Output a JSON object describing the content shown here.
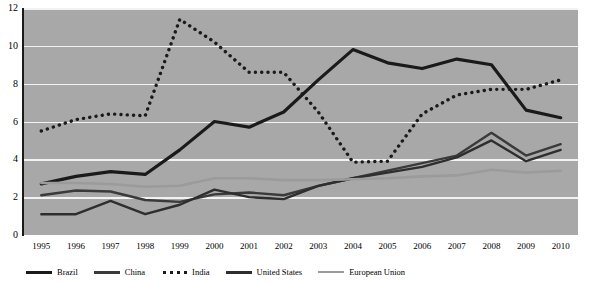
{
  "chart_data": {
    "type": "line",
    "title": "",
    "xlabel": "",
    "ylabel": "",
    "x": [
      1995,
      1996,
      1997,
      1998,
      1999,
      2000,
      2001,
      2002,
      2003,
      2004,
      2005,
      2006,
      2007,
      2008,
      2009,
      2010
    ],
    "xtick_labels": [
      "1995",
      "1996",
      "1997",
      "1998",
      "1999",
      "2000",
      "2001",
      "2002",
      "2003",
      "2004",
      "2005",
      "2006",
      "2007",
      "2008",
      "2009",
      "2010"
    ],
    "ytick_labels": [
      "0",
      "2",
      "4",
      "6",
      "8",
      "10",
      "12"
    ],
    "yticks": [
      0,
      2,
      4,
      6,
      8,
      10,
      12
    ],
    "ylim": [
      0,
      12
    ],
    "grid": true,
    "legend_position": "bottom",
    "plot_background": "#a8a8a8",
    "gridline_color": "#f2f2f2",
    "series": [
      {
        "name": "Brazil",
        "color": "#1a1a1a",
        "style": "solid",
        "width": 3.2,
        "values": [
          2.7,
          3.1,
          3.35,
          3.2,
          4.5,
          6.0,
          5.7,
          6.5,
          8.2,
          9.8,
          9.1,
          8.8,
          9.3,
          9.0,
          6.6,
          6.2
        ]
      },
      {
        "name": "China",
        "color": "#3a3a3a",
        "style": "solid",
        "width": 2.4,
        "values": [
          2.1,
          2.35,
          2.3,
          1.85,
          1.75,
          2.15,
          2.25,
          2.1,
          2.6,
          3.0,
          3.4,
          3.8,
          4.2,
          5.4,
          4.2,
          4.8
        ]
      },
      {
        "name": "India",
        "color": "#1a1a1a",
        "style": "dotted",
        "width": 3.0,
        "values": [
          5.5,
          6.1,
          6.4,
          6.3,
          11.4,
          10.2,
          8.6,
          8.6,
          6.5,
          3.85,
          3.9,
          6.4,
          7.4,
          7.7,
          7.7,
          8.2
        ]
      },
      {
        "name": "United States",
        "color": "#2e2e2e",
        "style": "solid",
        "width": 2.4,
        "values": [
          1.1,
          1.1,
          1.8,
          1.1,
          1.6,
          2.4,
          2.0,
          1.9,
          2.6,
          3.0,
          3.3,
          3.6,
          4.1,
          5.0,
          3.9,
          4.5
        ]
      },
      {
        "name": "European Union",
        "color": "#9b9b9b",
        "style": "solid",
        "width": 2.6,
        "values": [
          2.75,
          2.75,
          2.7,
          2.55,
          2.6,
          3.0,
          3.0,
          2.9,
          2.9,
          2.95,
          3.0,
          3.1,
          3.15,
          3.45,
          3.3,
          3.4
        ]
      }
    ]
  },
  "legend": {
    "items": [
      {
        "label": "Brazil",
        "swatch": "solid-dark"
      },
      {
        "label": "China",
        "swatch": "solid-mid"
      },
      {
        "label": "India",
        "swatch": "dotted"
      },
      {
        "label": "United States",
        "swatch": "solid-us"
      },
      {
        "label": "European Union",
        "swatch": "gray"
      }
    ]
  },
  "axes": {
    "y": {
      "labels": [
        "12",
        "10",
        "8",
        "6",
        "4",
        "2",
        "0"
      ]
    },
    "x": {
      "labels": [
        "1995",
        "1996",
        "1997",
        "1998",
        "1999",
        "2000",
        "2001",
        "2002",
        "2003",
        "2004",
        "2005",
        "2006",
        "2007",
        "2008",
        "2009",
        "2010"
      ]
    }
  }
}
